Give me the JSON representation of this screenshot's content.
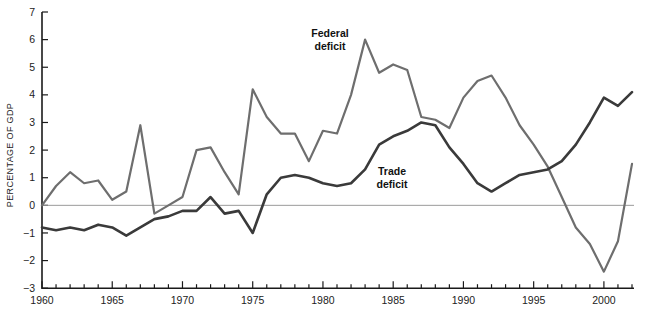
{
  "chart_data": {
    "type": "line",
    "title": "",
    "xlabel": "",
    "ylabel": "PERCENTAGE OF GDP",
    "xlim": [
      1960,
      2002
    ],
    "ylim": [
      -3,
      7
    ],
    "grid": false,
    "legend_position": "inline-annotation",
    "zero_line": true,
    "x_tick_labels": [
      "1960",
      "1965",
      "1970",
      "1975",
      "1980",
      "1985",
      "1990",
      "1995",
      "2000"
    ],
    "x_tick_values": [
      1960,
      1965,
      1970,
      1975,
      1980,
      1985,
      1990,
      1995,
      2000
    ],
    "x_minor_tick_step": 1,
    "y_tick_labels": [
      "7",
      "6",
      "5",
      "4",
      "3",
      "2",
      "1",
      "0",
      "-1",
      "-2",
      "-3"
    ],
    "y_tick_values": [
      7,
      6,
      5,
      4,
      3,
      2,
      1,
      0,
      -1,
      -2,
      -3
    ],
    "x": [
      1960,
      1961,
      1962,
      1963,
      1964,
      1965,
      1966,
      1967,
      1968,
      1969,
      1970,
      1971,
      1972,
      1973,
      1974,
      1975,
      1976,
      1977,
      1978,
      1979,
      1980,
      1981,
      1982,
      1983,
      1984,
      1985,
      1986,
      1987,
      1988,
      1989,
      1990,
      1991,
      1992,
      1993,
      1994,
      1995,
      1996,
      1997,
      1998,
      1999,
      2000,
      2001,
      2002
    ],
    "series": [
      {
        "name": "Federal deficit",
        "color": "#6e6e6e",
        "label_text_line1": "Federal",
        "label_text_line2": "deficit",
        "values": [
          0.0,
          0.7,
          1.2,
          0.8,
          0.9,
          0.2,
          0.5,
          2.9,
          -0.3,
          0.0,
          0.3,
          2.0,
          2.1,
          1.2,
          0.4,
          4.2,
          3.2,
          2.6,
          2.6,
          1.6,
          2.7,
          2.6,
          4.0,
          6.0,
          4.8,
          5.1,
          4.9,
          3.2,
          3.1,
          2.8,
          3.9,
          4.5,
          4.7,
          3.9,
          2.9,
          2.2,
          1.4,
          0.3,
          -0.8,
          -1.4,
          -2.4,
          -1.3,
          1.5
        ]
      },
      {
        "name": "Trade deficit",
        "color": "#3a3a3a",
        "label_text_line1": "Trade",
        "label_text_line2": "deficit",
        "values": [
          -0.8,
          -0.9,
          -0.8,
          -0.9,
          -0.7,
          -0.8,
          -1.1,
          -0.8,
          -0.5,
          -0.4,
          -0.2,
          -0.2,
          0.3,
          -0.3,
          -0.2,
          -1.0,
          0.4,
          1.0,
          1.1,
          1.0,
          0.8,
          0.7,
          0.8,
          1.3,
          2.2,
          2.5,
          2.7,
          3.0,
          2.9,
          2.1,
          1.5,
          0.8,
          0.5,
          0.8,
          1.1,
          1.2,
          1.3,
          1.6,
          2.2,
          3.0,
          3.9,
          3.6,
          4.1
        ]
      }
    ],
    "annotations": [
      {
        "text": "Federal deficit",
        "series": "Federal deficit",
        "x": 1981.2,
        "y": 5.3
      },
      {
        "text": "Trade deficit",
        "series": "Trade deficit",
        "x": 1985.0,
        "y": 1.2
      }
    ]
  },
  "style": {
    "background": "#ffffff",
    "axis_color": "#1a1a1a",
    "zero_line_color": "#9a9a9a",
    "federal_color": "#6e6e6e",
    "trade_color": "#3a3a3a"
  }
}
